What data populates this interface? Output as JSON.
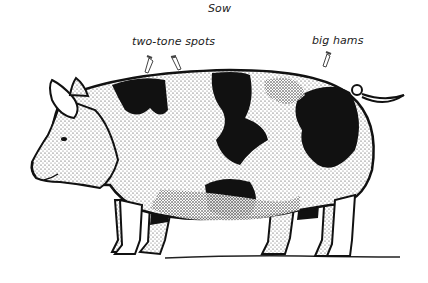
{
  "figure": {
    "title": "Sow",
    "annotations": [
      {
        "label": "two-tone spots",
        "pointers": 2
      },
      {
        "label": "big hams",
        "pointers": 1
      }
    ],
    "colors": {
      "ink": "#111111",
      "background": "#ffffff"
    }
  }
}
